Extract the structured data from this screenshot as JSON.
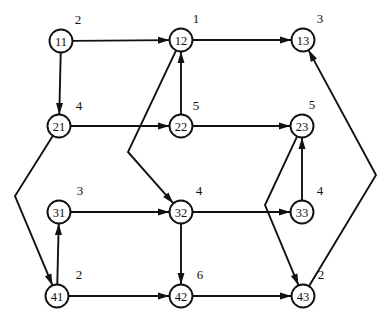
{
  "diagram": {
    "type": "node-link-diagram",
    "width": 389,
    "height": 324,
    "background_color": "#ffffff",
    "stroke_color": "#111111",
    "node_radius": 11.5,
    "nodes": [
      {
        "id": "11",
        "label": "11",
        "x": 61,
        "y": 41,
        "weight": "2",
        "weight_x": 78,
        "weight_y": 19
      },
      {
        "id": "12",
        "label": "12",
        "x": 181,
        "y": 40,
        "weight": "1",
        "weight_x": 196,
        "weight_y": 18
      },
      {
        "id": "13",
        "label": "13",
        "x": 303,
        "y": 40,
        "weight": "3",
        "weight_x": 320,
        "weight_y": 18
      },
      {
        "id": "21",
        "label": "21",
        "x": 59,
        "y": 126,
        "weight": "4",
        "weight_x": 79,
        "weight_y": 105
      },
      {
        "id": "22",
        "label": "22",
        "x": 181,
        "y": 126,
        "weight": "5",
        "weight_x": 196,
        "weight_y": 105
      },
      {
        "id": "23",
        "label": "23",
        "x": 302,
        "y": 126,
        "weight": "5",
        "weight_x": 312,
        "weight_y": 104
      },
      {
        "id": "31",
        "label": "31",
        "x": 59,
        "y": 212,
        "weight": "3",
        "weight_x": 80,
        "weight_y": 190
      },
      {
        "id": "32",
        "label": "32",
        "x": 181,
        "y": 212,
        "weight": "4",
        "weight_x": 199,
        "weight_y": 190
      },
      {
        "id": "33",
        "label": "33",
        "x": 302,
        "y": 212,
        "weight": "4",
        "weight_x": 320,
        "weight_y": 190
      },
      {
        "id": "41",
        "label": "41",
        "x": 57,
        "y": 296,
        "weight": "2",
        "weight_x": 79,
        "weight_y": 274
      },
      {
        "id": "42",
        "label": "42",
        "x": 181,
        "y": 296,
        "weight": "6",
        "weight_x": 200,
        "weight_y": 274
      },
      {
        "id": "43",
        "label": "43",
        "x": 303,
        "y": 296,
        "weight": "2",
        "weight_x": 321,
        "weight_y": 274
      }
    ],
    "edges": [
      {
        "id": "e-11-12",
        "from": "11",
        "to": "12",
        "bend": null
      },
      {
        "id": "e-12-13",
        "from": "12",
        "to": "13",
        "bend": null
      },
      {
        "id": "e-11-21",
        "from": "11",
        "to": "21",
        "bend": null
      },
      {
        "id": "e-21-22",
        "from": "21",
        "to": "22",
        "bend": null
      },
      {
        "id": "e-22-23",
        "from": "22",
        "to": "23",
        "bend": null
      },
      {
        "id": "e-22-12",
        "from": "22",
        "to": "12",
        "bend": null
      },
      {
        "id": "e-31-32",
        "from": "31",
        "to": "32",
        "bend": null
      },
      {
        "id": "e-41-31",
        "from": "41",
        "to": "31",
        "bend": null
      },
      {
        "id": "e-32-42",
        "from": "32",
        "to": "42",
        "bend": null
      },
      {
        "id": "e-41-42",
        "from": "41",
        "to": "42",
        "bend": null
      },
      {
        "id": "e-42-43",
        "from": "42",
        "to": "43",
        "bend": null
      },
      {
        "id": "e-32-33",
        "from": "32",
        "to": "33",
        "bend": null
      },
      {
        "id": "e-33-23",
        "from": "33",
        "to": "23",
        "bend": null
      },
      {
        "id": "e-21-41",
        "from": "21",
        "to": "41",
        "bend": {
          "x": 15,
          "y": 196
        }
      },
      {
        "id": "e-12-32",
        "from": "12",
        "to": "32",
        "bend": {
          "x": 128,
          "y": 152
        }
      },
      {
        "id": "e-23-43",
        "from": "23",
        "to": "43",
        "bend": {
          "x": 265,
          "y": 205
        }
      },
      {
        "id": "e-43-13",
        "from": "43",
        "to": "13",
        "bend": {
          "x": 376,
          "y": 175
        }
      }
    ]
  }
}
